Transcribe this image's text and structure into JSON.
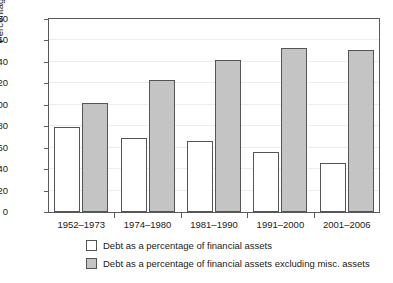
{
  "chart_data": {
    "type": "bar",
    "title": "",
    "xlabel": "",
    "ylabel": "Percentage",
    "ylim": [
      0,
      180
    ],
    "ytick_step": 20,
    "yticks": [
      180,
      160,
      140,
      120,
      100,
      80,
      60,
      40,
      20,
      0
    ],
    "grid": true,
    "legend_position": "below-axis",
    "categories": [
      "1952–1973",
      "1974–1980",
      "1981–1990",
      "1991–2000",
      "2001–2006"
    ],
    "series": [
      {
        "name": "Debt as a percentage of financial assets",
        "color": "#ffffff",
        "values": [
          79,
          69,
          66,
          56,
          46
        ]
      },
      {
        "name": "Debt as a percentage of financial assets excluding misc. assets",
        "color": "#c4c4c4",
        "values": [
          102,
          123,
          142,
          153,
          151
        ]
      }
    ]
  },
  "legend": {
    "items": [
      {
        "label": "Debt as a percentage of financial assets",
        "swatch": "white-square-icon"
      },
      {
        "label": "Debt as a percentage of financial assets excluding misc. assets",
        "swatch": "gray-square-icon"
      }
    ]
  }
}
